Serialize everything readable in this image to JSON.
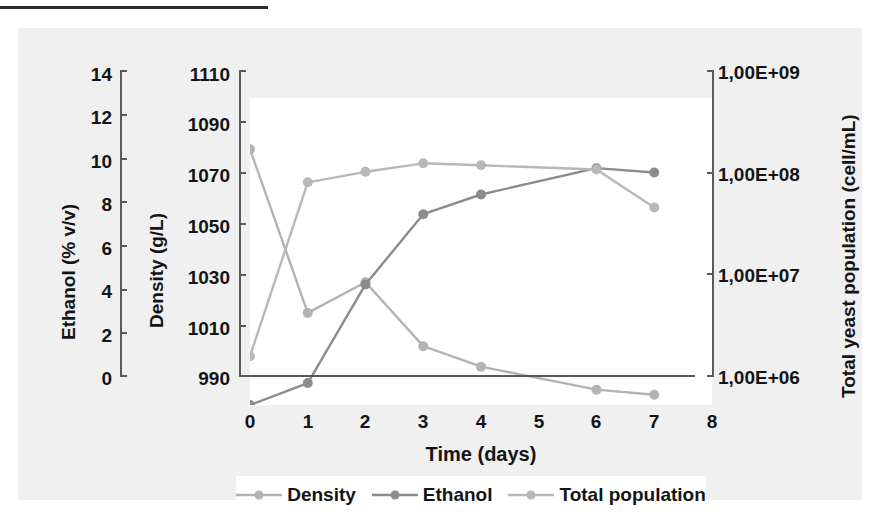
{
  "figure": {
    "background_color": "#f0f0f0",
    "plot_background_color": "#ffffff"
  },
  "axes": {
    "ethanol": {
      "title": "Ethanol (% v/v)",
      "ticks": [
        "14",
        "12",
        "10",
        "8",
        "6",
        "4",
        "2",
        "0"
      ],
      "min": 0,
      "max": 14
    },
    "density": {
      "title": "Density (g/L)",
      "ticks": [
        "1110",
        "1090",
        "1070",
        "1050",
        "1030",
        "1010",
        "990"
      ],
      "min": 990,
      "max": 1110
    },
    "population": {
      "title": "Total yeast population (cell/mL)",
      "ticks": [
        "1,00E+09",
        "1,00E+08",
        "1,00E+07",
        "1,00E+06"
      ],
      "min": 1000000,
      "max": 1000000000,
      "scale": "log"
    },
    "x": {
      "title": "Time (days)",
      "ticks": [
        "0",
        "1",
        "2",
        "3",
        "4",
        "5",
        "6",
        "7",
        "8"
      ],
      "min": 0,
      "max": 8
    }
  },
  "legend": {
    "items": [
      {
        "label": "Density",
        "color": "#b3b3b3"
      },
      {
        "label": "Ethanol",
        "color": "#8c8c8c"
      },
      {
        "label": "Total population",
        "color": "#b8b8b8"
      }
    ]
  },
  "chart_data": {
    "type": "line",
    "title": "",
    "xlabel": "Time (days)",
    "ylabel": "Ethanol (% v/v) / Density (g/L)",
    "xlim": [
      0,
      8
    ],
    "grid": false,
    "legend_position": "bottom",
    "x": [
      0,
      1,
      2,
      3,
      4,
      6,
      7
    ],
    "series": [
      {
        "name": "Density",
        "axis": "density",
        "unit": "g/L",
        "ylim": [
          990,
          1110
        ],
        "color": "#b3b3b3",
        "values": [
          1090,
          1026,
          1038,
          1013,
          1005,
          996,
          994
        ]
      },
      {
        "name": "Ethanol",
        "axis": "ethanol",
        "unit": "% v/v",
        "ylim": [
          0,
          14
        ],
        "color": "#8c8c8c",
        "values": [
          0,
          1.0,
          5.5,
          8.7,
          9.6,
          10.8,
          10.6
        ]
      },
      {
        "name": "Total population",
        "axis": "population",
        "unit": "cell/mL",
        "ylim": [
          1000000,
          1000000000
        ],
        "scale": "log",
        "color": "#b8b8b8",
        "values": [
          3000000,
          150000000,
          190000000,
          230000000,
          220000000,
          200000000,
          85000000
        ]
      }
    ]
  }
}
